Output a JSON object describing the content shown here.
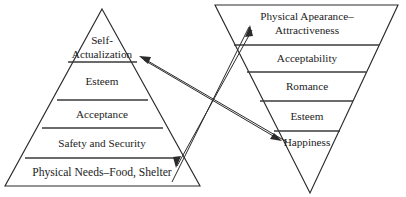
{
  "diagram": {
    "background_color": "#ffffff",
    "line_color": "#2b2b2b",
    "text_color": "#1c1c1c"
  },
  "left_pyramid": {
    "name": "maslow-pyramid",
    "orientation": "apex-up",
    "levels": [
      {
        "id": "self-actualization",
        "label_line1": "Self-",
        "label_line2": "Actualization",
        "position_from_top": 1
      },
      {
        "id": "esteem",
        "label": "Esteem",
        "position_from_top": 2
      },
      {
        "id": "acceptance",
        "label": "Acceptance",
        "position_from_top": 3
      },
      {
        "id": "safety-and-security",
        "label": "Safety and Security",
        "position_from_top": 4
      },
      {
        "id": "physical-needs",
        "label": "Physical Needs–Food, Shelter",
        "position_from_top": 5
      }
    ]
  },
  "right_pyramid": {
    "name": "inverted-pyramid",
    "orientation": "apex-down",
    "levels": [
      {
        "id": "physical-appearance",
        "label_line1": "Physical Apearance–",
        "label_line2": "Attractiveness",
        "position_from_top": 1
      },
      {
        "id": "acceptability",
        "label": "Acceptability",
        "position_from_top": 2
      },
      {
        "id": "romance",
        "label": "Romance",
        "position_from_top": 3
      },
      {
        "id": "esteem-right",
        "label": "Esteem",
        "position_from_top": 4
      },
      {
        "id": "happiness",
        "label": "Happiness",
        "position_from_top": 5
      }
    ]
  },
  "connectors": [
    {
      "id": "arrow-to-self-actualization",
      "from": "right pyramid lower area",
      "to": "Self-Actualization",
      "direction": "up-left"
    },
    {
      "id": "arrow-to-physical-appearance",
      "from": "Physical Needs–Food, Shelter",
      "to": "Physical Apearance–Attractiveness",
      "direction": "up-right"
    },
    {
      "id": "arrow-to-happiness",
      "from": "upper left region",
      "to": "Happiness",
      "direction": "down-right"
    },
    {
      "id": "arrow-to-physical-needs",
      "from": "upper right region",
      "to": "Physical Needs–Food, Shelter",
      "direction": "down-left"
    }
  ]
}
